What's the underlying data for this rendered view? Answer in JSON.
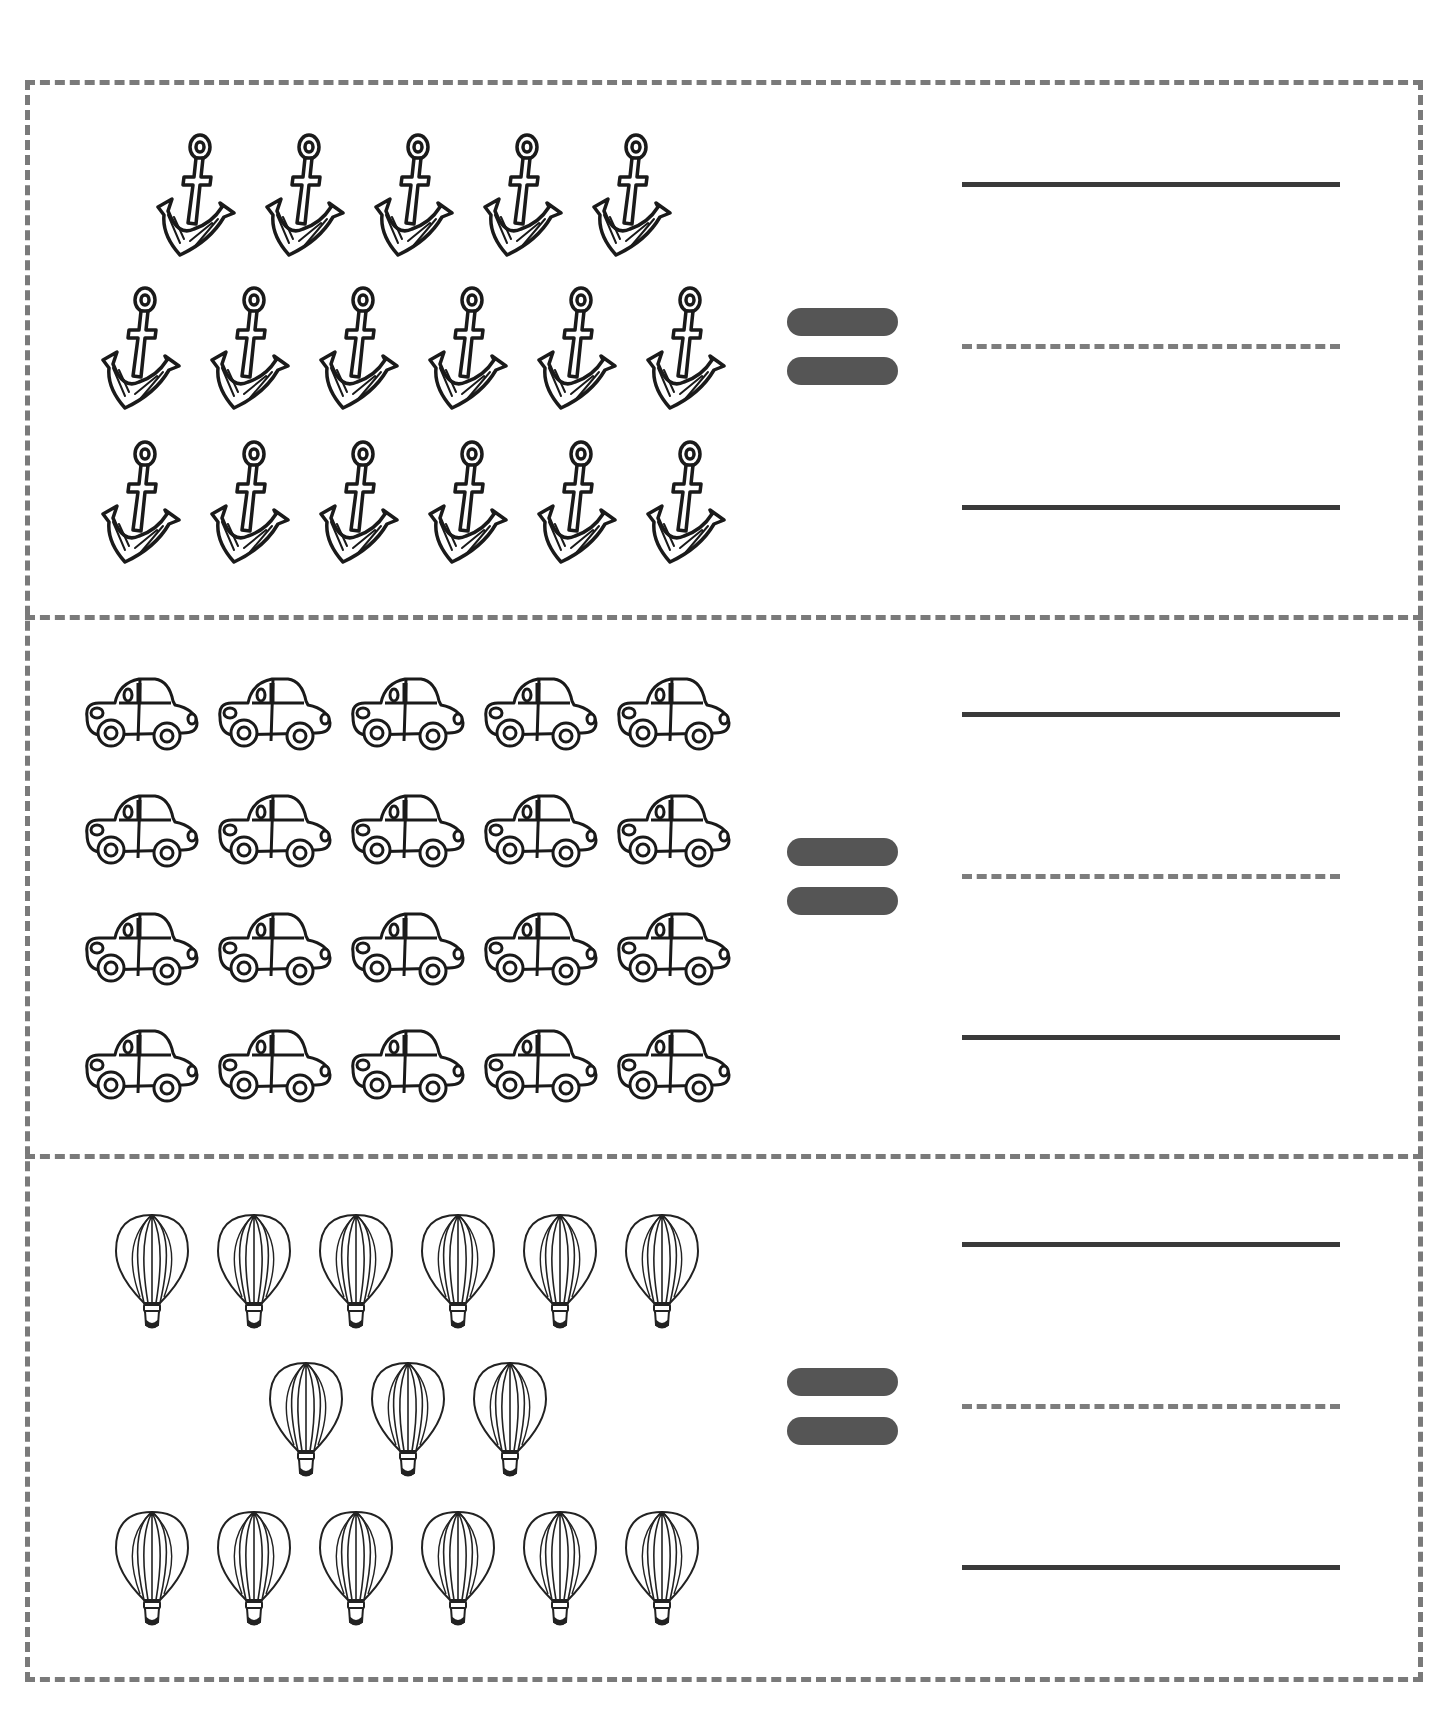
{
  "worksheet": {
    "type": "counting-write-the-number",
    "border_color": "#7a7a7a",
    "equals_color": "#555555",
    "writing_line_color": "#3a3a3a",
    "guide_line_color": "#7d7d7d",
    "sections": [
      {
        "object": "anchor-icon",
        "rows": [
          5,
          6,
          6
        ],
        "count": 17,
        "operator": "=",
        "answer": ""
      },
      {
        "object": "car-icon",
        "rows": [
          5,
          5,
          5,
          5
        ],
        "count": 20,
        "operator": "=",
        "answer": ""
      },
      {
        "object": "hot-air-balloon-icon",
        "rows": [
          6,
          3,
          6
        ],
        "count": 15,
        "operator": "=",
        "answer": ""
      }
    ]
  }
}
